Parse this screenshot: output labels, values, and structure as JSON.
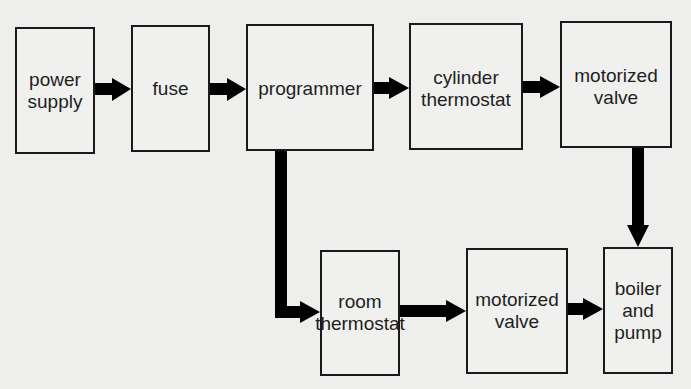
{
  "diagram": {
    "type": "block-flow",
    "colors": {
      "background": "#eeeeec",
      "box_border": "#1a1a1a",
      "arrow": "#000000",
      "text": "#1e1e1e"
    },
    "nodes": [
      {
        "id": "power_supply",
        "lines": [
          "power",
          "supply"
        ]
      },
      {
        "id": "fuse",
        "lines": [
          "fuse"
        ]
      },
      {
        "id": "programmer",
        "lines": [
          "programmer"
        ]
      },
      {
        "id": "cylinder_thermostat",
        "lines": [
          "cylinder",
          "thermostat"
        ]
      },
      {
        "id": "motorized_valve_hw",
        "lines": [
          "motorized",
          "valve"
        ]
      },
      {
        "id": "room_thermostat",
        "lines": [
          "room",
          "thermostat"
        ]
      },
      {
        "id": "motorized_valve_ch",
        "lines": [
          "motorized",
          "valve"
        ]
      },
      {
        "id": "boiler_and_pump",
        "lines": [
          "boiler",
          "and",
          "pump"
        ]
      }
    ],
    "edges": [
      {
        "from": "power_supply",
        "to": "fuse"
      },
      {
        "from": "fuse",
        "to": "programmer"
      },
      {
        "from": "programmer",
        "to": "cylinder_thermostat"
      },
      {
        "from": "cylinder_thermostat",
        "to": "motorized_valve_hw"
      },
      {
        "from": "motorized_valve_hw",
        "to": "boiler_and_pump"
      },
      {
        "from": "programmer",
        "to": "room_thermostat"
      },
      {
        "from": "room_thermostat",
        "to": "motorized_valve_ch"
      },
      {
        "from": "motorized_valve_ch",
        "to": "boiler_and_pump"
      }
    ]
  }
}
